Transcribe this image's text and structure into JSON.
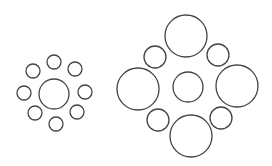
{
  "diagram": {
    "title": "",
    "stroke_color": "#444444",
    "background": "#ffffff",
    "groups": [
      {
        "name": "small-surround-group",
        "center": {
          "cx": 54,
          "cy": 94,
          "r": 15
        },
        "surround": [
          {
            "cx": 54,
            "cy": 62,
            "r": 7
          },
          {
            "cx": 33,
            "cy": 71,
            "r": 7
          },
          {
            "cx": 75,
            "cy": 69,
            "r": 7
          },
          {
            "cx": 24,
            "cy": 93,
            "r": 7
          },
          {
            "cx": 85,
            "cy": 92,
            "r": 7
          },
          {
            "cx": 35,
            "cy": 113,
            "r": 7
          },
          {
            "cx": 77,
            "cy": 112,
            "r": 7
          },
          {
            "cx": 56,
            "cy": 124,
            "r": 7
          }
        ]
      },
      {
        "name": "large-surround-group",
        "center": {
          "cx": 188,
          "cy": 87,
          "r": 15
        },
        "surround": [
          {
            "cx": 186,
            "cy": 36,
            "r": 21
          },
          {
            "cx": 138,
            "cy": 89,
            "r": 21
          },
          {
            "cx": 237,
            "cy": 86,
            "r": 21
          },
          {
            "cx": 191,
            "cy": 136,
            "r": 21
          },
          {
            "cx": 155,
            "cy": 57,
            "r": 11
          },
          {
            "cx": 218,
            "cy": 55,
            "r": 11
          },
          {
            "cx": 158,
            "cy": 120,
            "r": 11
          },
          {
            "cx": 221,
            "cy": 118,
            "r": 11
          }
        ]
      }
    ]
  }
}
